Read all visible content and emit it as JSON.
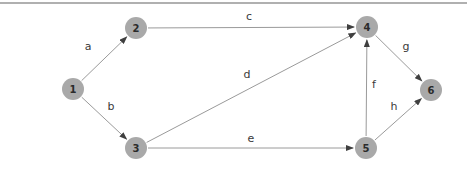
{
  "diagram": {
    "type": "directed-graph",
    "background": "#ffffff",
    "top_rule": {
      "color": "#b0b0b0",
      "thickness": 2,
      "y": 2
    },
    "style": {
      "node_fill": "#a9a9a9",
      "node_radius": 11,
      "node_text_color": "#2b2b2b",
      "edge_color": "#9a9a9a",
      "arrow_color": "#3f3f3f",
      "edge_label_color": "#3a3a3a"
    },
    "nodes": [
      {
        "id": "1",
        "x": 73,
        "y": 89
      },
      {
        "id": "2",
        "x": 136,
        "y": 28
      },
      {
        "id": "3",
        "x": 136,
        "y": 148
      },
      {
        "id": "4",
        "x": 367,
        "y": 27
      },
      {
        "id": "5",
        "x": 366,
        "y": 148
      },
      {
        "id": "6",
        "x": 431,
        "y": 90
      }
    ],
    "edges": [
      {
        "label": "a",
        "from": "1",
        "to": "2",
        "label_x": 88,
        "label_y": 50
      },
      {
        "label": "b",
        "from": "1",
        "to": "3",
        "label_x": 111,
        "label_y": 110
      },
      {
        "label": "c",
        "from": "2",
        "to": "4",
        "label_x": 249,
        "label_y": 20
      },
      {
        "label": "d",
        "from": "3",
        "to": "4",
        "label_x": 247,
        "label_y": 78
      },
      {
        "label": "e",
        "from": "3",
        "to": "5",
        "label_x": 251,
        "label_y": 142
      },
      {
        "label": "f",
        "from": "5",
        "to": "4",
        "label_x": 374,
        "label_y": 88
      },
      {
        "label": "g",
        "from": "4",
        "to": "6",
        "label_x": 406,
        "label_y": 50
      },
      {
        "label": "h",
        "from": "5",
        "to": "6",
        "label_x": 394,
        "label_y": 110
      }
    ]
  }
}
